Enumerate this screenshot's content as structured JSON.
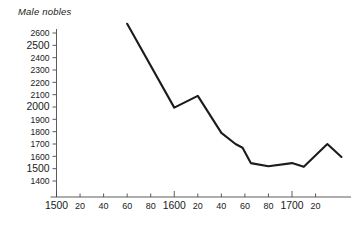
{
  "chart_data": {
    "type": "line",
    "title": "Male nobles",
    "xlabel": "",
    "ylabel": "",
    "xlim": [
      1500,
      1745
    ],
    "ylim": [
      1400,
      2600
    ],
    "grid": false,
    "legend": null,
    "x_tick_labels": [
      "1500",
      "20",
      "40",
      "60",
      "80",
      "1600",
      "20",
      "40",
      "60",
      "80",
      "1700",
      "20"
    ],
    "x_tick_values": [
      1500,
      1520,
      1540,
      1560,
      1580,
      1600,
      1620,
      1640,
      1660,
      1680,
      1700,
      1720
    ],
    "y_tick_labels": [
      "2600",
      "2500",
      "2400",
      "2300",
      "2200",
      "2100",
      "2000",
      "1900",
      "1800",
      "1700",
      "1600",
      "1500",
      "1400"
    ],
    "y_tick_values": [
      2600,
      2500,
      2400,
      2300,
      2200,
      2100,
      2000,
      1900,
      1800,
      1700,
      1600,
      1500,
      1400
    ],
    "series": [
      {
        "name": "Male nobles",
        "color": "#1c1c1c",
        "x": [
          1560,
          1600,
          1620,
          1640,
          1652,
          1658,
          1665,
          1680,
          1700,
          1710,
          1730,
          1742
        ],
        "values": [
          2675,
          1995,
          2090,
          1790,
          1700,
          1670,
          1545,
          1520,
          1545,
          1515,
          1700,
          1595
        ]
      }
    ]
  }
}
